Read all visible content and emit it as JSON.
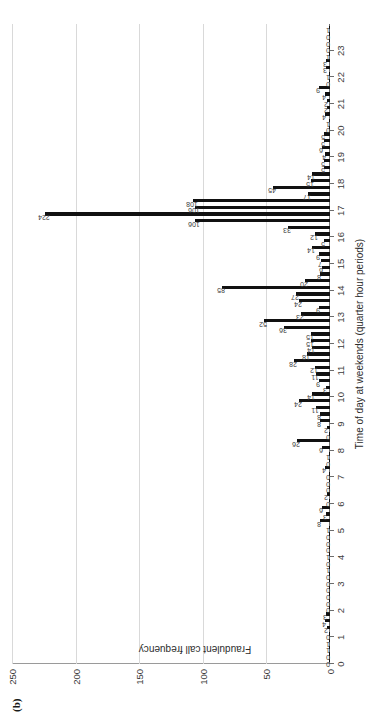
{
  "figure": {
    "panel_label": "(b)"
  },
  "chart_data": {
    "type": "bar",
    "title": "",
    "xlabel": "Time of day at weekends (quarter hour periods)",
    "ylabel": "Fraudulent call frequency",
    "ylim": [
      0,
      250
    ],
    "yticks": [
      0,
      50,
      100,
      150,
      200,
      250
    ],
    "ytick_labels": [
      "0",
      "50",
      "100",
      "150",
      "200",
      "250"
    ],
    "grid": true,
    "grid_axis": "y",
    "legend": "none",
    "bar_color": "#111111",
    "grid_color": "#d9d9d9",
    "axis_color": "#6d6d6d",
    "x_category_labels": [
      "0",
      "1",
      "2",
      "3",
      "4",
      "5",
      "6",
      "7",
      "8",
      "9",
      "10",
      "11",
      "12",
      "13",
      "14",
      "15",
      "16",
      "17",
      "18",
      "19",
      "20",
      "21",
      "22",
      "23"
    ],
    "x_note": "each hour is subdivided into 4 quarter-hour periods",
    "values": [
      0,
      0,
      1,
      1,
      0,
      2,
      4,
      3,
      0,
      0,
      0,
      0,
      0,
      0,
      1,
      0,
      1,
      0,
      0,
      0,
      1,
      8,
      3,
      6,
      0,
      2,
      0,
      0,
      0,
      4,
      0,
      1,
      6,
      26,
      0,
      2,
      8,
      8,
      11,
      24,
      14,
      3,
      9,
      11,
      12,
      28,
      18,
      14,
      15,
      15,
      36,
      52,
      23,
      9,
      24,
      27,
      85,
      20,
      8,
      6,
      7,
      9,
      14,
      5,
      12,
      33,
      106,
      224,
      106,
      108,
      17,
      45,
      15,
      14,
      5,
      5,
      4,
      6,
      5,
      5,
      0,
      1,
      4,
      2,
      2,
      4,
      9,
      0,
      1,
      3,
      3,
      1,
      0,
      0,
      0,
      1
    ],
    "labeled_points": [
      {
        "index": 67,
        "value": 224,
        "note": "peak at 16:45"
      },
      {
        "index": 66,
        "value": 106
      },
      {
        "index": 68,
        "value": 106
      },
      {
        "index": 69,
        "value": 108
      },
      {
        "index": 71,
        "value": 45
      },
      {
        "index": 56,
        "value": 85
      },
      {
        "index": 51,
        "value": 52
      },
      {
        "index": 50,
        "value": 36
      },
      {
        "index": 65,
        "value": 33
      },
      {
        "index": 45,
        "value": 28
      },
      {
        "index": 55,
        "value": 27
      },
      {
        "index": 33,
        "value": 26
      },
      {
        "index": 39,
        "value": 24
      },
      {
        "index": 54,
        "value": 24
      },
      {
        "index": 52,
        "value": 23
      },
      {
        "index": 57,
        "value": 20
      },
      {
        "index": 46,
        "value": 18
      },
      {
        "index": 70,
        "value": 17
      }
    ]
  }
}
